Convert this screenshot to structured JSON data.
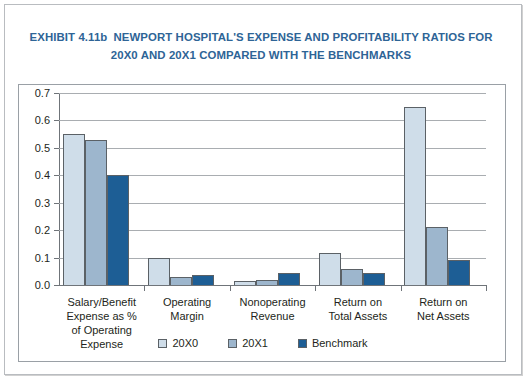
{
  "title": {
    "exhibit_id": "EXHIBIT 4.11b",
    "line1": "NEWPORT HOSPITAL'S EXPENSE AND PROFITABILITY RATIOS FOR",
    "line2": "20X0 AND 20X1 COMPARED WITH THE BENCHMARKS",
    "color": "#2e6496"
  },
  "chart_data": {
    "type": "bar",
    "xlabel": "",
    "ylabel": "",
    "ylim": [
      0.0,
      0.7
    ],
    "ytick_labels": [
      "0.0",
      "0.1",
      "0.2",
      "0.3",
      "0.4",
      "0.5",
      "0.6",
      "0.7"
    ],
    "ytick_values": [
      0.0,
      0.1,
      0.2,
      0.3,
      0.4,
      0.5,
      0.6,
      0.7
    ],
    "grid": true,
    "legend_position": "bottom",
    "categories": [
      "Salary/Benefit Expense as % of Operating Expense",
      "Operating Margin",
      "Nonoperating Revenue",
      "Return on Total Assets",
      "Return on Net Assets"
    ],
    "category_label_lines": [
      [
        "Salary/Benefit",
        "Expense as %",
        "of Operating",
        "Expense"
      ],
      [
        "Operating",
        "Margin"
      ],
      [
        "Nonoperating",
        "Revenue"
      ],
      [
        "Return on",
        "Total Assets"
      ],
      [
        "Return on",
        "Net Assets"
      ]
    ],
    "series": [
      {
        "name": "20X0",
        "color": "#cfdde9",
        "values": [
          0.55,
          0.1,
          0.015,
          0.115,
          0.65
        ]
      },
      {
        "name": "20X1",
        "color": "#9db6cd",
        "values": [
          0.53,
          0.03,
          0.02,
          0.06,
          0.21
        ]
      },
      {
        "name": "Benchmark",
        "color": "#1d5e95",
        "values": [
          0.4,
          0.035,
          0.045,
          0.045,
          0.09
        ]
      }
    ]
  },
  "legend": {
    "items": [
      {
        "label": "20X0"
      },
      {
        "label": "20X1"
      },
      {
        "label": "Benchmark"
      }
    ]
  }
}
